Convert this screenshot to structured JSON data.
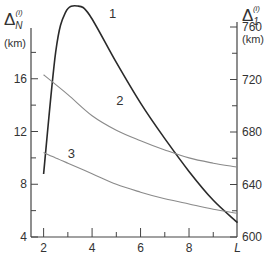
{
  "chart_data": {
    "type": "line",
    "title": "",
    "xlabel": "L",
    "ylabel_left": "ΔN(i) (km)",
    "ylabel_right": "Δ1(i) (km)",
    "ylabel_left_main": "Δ",
    "ylabel_left_sub": "N",
    "ylabel_left_sup": "(i)",
    "ylabel_left_unit": "(km)",
    "ylabel_right_main": "Δ",
    "ylabel_right_sub": "1",
    "ylabel_right_sup": "(i)",
    "ylabel_right_unit": "(km)",
    "xlim": [
      1.5,
      10
    ],
    "ylim_left": [
      4,
      20
    ],
    "ylim_right": [
      600,
      780
    ],
    "x_ticks_major": [
      2,
      4,
      6,
      8
    ],
    "x_ticks_minor": [
      3,
      5,
      7,
      9
    ],
    "x_tick_labels": [
      "2",
      "4",
      "6",
      "8",
      "L"
    ],
    "y_left_tick_labels": [
      "4",
      "8",
      "12",
      "16"
    ],
    "y_left_ticks": [
      4,
      6,
      8,
      10,
      12,
      14,
      16,
      18
    ],
    "y_right_tick_labels": [
      "600",
      "640",
      "680",
      "720",
      "760"
    ],
    "y_right_ticks": [
      600,
      620,
      640,
      660,
      680,
      700,
      720,
      740,
      760
    ],
    "grid": false,
    "legend": "inline curve labels 1, 2, 3",
    "series": [
      {
        "name": "1",
        "axis": "right",
        "style": "bold dark",
        "x": [
          2.0,
          2.5,
          2.9,
          3.4,
          3.9,
          5.0,
          6.0,
          7.0,
          8.0,
          9.0,
          10.0
        ],
        "values": [
          648,
          741,
          771,
          776,
          769,
          733,
          702,
          675,
          650,
          628,
          611
        ]
      },
      {
        "name": "2",
        "axis": "left",
        "style": "thin grey",
        "x": [
          2.0,
          3.0,
          4.0,
          5.0,
          6.0,
          7.0,
          8.0,
          9.0,
          10.0
        ],
        "values": [
          16.3,
          14.8,
          13.2,
          12.1,
          11.3,
          10.6,
          10.0,
          9.6,
          9.3
        ]
      },
      {
        "name": "3",
        "axis": "left",
        "style": "thin grey",
        "x": [
          2.0,
          2.5,
          3.0,
          4.0,
          5.0,
          6.0,
          7.0,
          8.0,
          9.0,
          10.0
        ],
        "values": [
          10.4,
          10.0,
          9.6,
          8.8,
          8.0,
          7.4,
          6.9,
          6.5,
          6.1,
          5.8
        ]
      }
    ],
    "curve_labels": [
      {
        "text": "1",
        "x": 4.7,
        "y_right": 767
      },
      {
        "text": "2",
        "x": 5.0,
        "y_left": 14.0
      },
      {
        "text": "3",
        "x": 3.0,
        "y_left": 10.0
      }
    ]
  }
}
